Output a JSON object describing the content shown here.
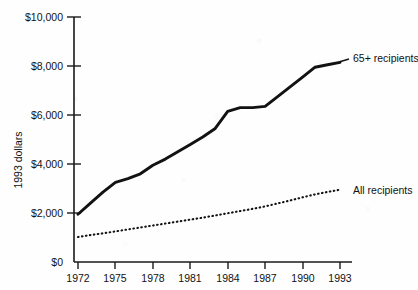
{
  "chart_data": {
    "type": "line",
    "title": "",
    "xlabel": "",
    "ylabel": "1993 dollars",
    "xlim": [
      1972,
      1993
    ],
    "ylim": [
      0,
      10000
    ],
    "grid": false,
    "legend_position": "inline-right-of-series",
    "x_ticks": [
      "1972",
      "1975",
      "1978",
      "1981",
      "1984",
      "1987",
      "1990",
      "1993"
    ],
    "x_tick_values": [
      1972,
      1975,
      1978,
      1981,
      1984,
      1987,
      1990,
      1993
    ],
    "y_ticks": [
      "$0",
      "$2,000",
      "$4,000",
      "$6,000",
      "$8,000",
      "$10,000"
    ],
    "y_tick_values": [
      0,
      2000,
      4000,
      6000,
      8000,
      10000
    ],
    "x": [
      1972,
      1973,
      1974,
      1975,
      1976,
      1977,
      1978,
      1979,
      1980,
      1981,
      1982,
      1983,
      1984,
      1985,
      1986,
      1987,
      1988,
      1989,
      1990,
      1991,
      1992,
      1993
    ],
    "series": [
      {
        "name": "65+ recipients",
        "style": "solid",
        "color": "#121212",
        "values": [
          1950,
          2400,
          2850,
          3250,
          3400,
          3600,
          3950,
          4200,
          4500,
          4800,
          5100,
          5450,
          6150,
          6300,
          6300,
          6350,
          6750,
          7150,
          7550,
          7950,
          8050,
          8150
        ]
      },
      {
        "name": "All recipients",
        "style": "dotted",
        "color": "#121212",
        "values": [
          1020,
          1100,
          1170,
          1250,
          1330,
          1410,
          1490,
          1570,
          1650,
          1730,
          1810,
          1900,
          1990,
          2080,
          2170,
          2270,
          2390,
          2510,
          2640,
          2760,
          2860,
          2950
        ]
      }
    ],
    "annotations": [
      {
        "text": "65+ recipients",
        "at_x": 1993,
        "at_y": 8150
      },
      {
        "text": "All recipients",
        "at_x": 1993,
        "at_y": 2950
      }
    ]
  },
  "axes": {
    "y_title": "1993 dollars"
  }
}
